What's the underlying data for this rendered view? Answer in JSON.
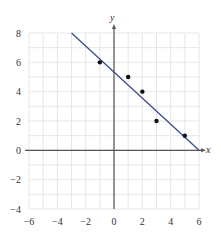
{
  "chart_data": {
    "type": "scatter",
    "title": "",
    "xlabel": "x",
    "ylabel": "y",
    "xlim": [
      -6,
      6
    ],
    "ylim": [
      -4,
      8
    ],
    "grid": true,
    "grid_step": 1,
    "x_ticks": [
      -6,
      -4,
      -2,
      0,
      2,
      4,
      6
    ],
    "y_ticks": [
      -4,
      -2,
      0,
      2,
      4,
      6,
      8
    ],
    "x_tick_labels": [
      "−6",
      "−4",
      "−2",
      "0",
      "2",
      "4",
      "6"
    ],
    "y_tick_labels": [
      "−4",
      "−2",
      "0",
      "2",
      "4",
      "6",
      "8"
    ],
    "points": [
      {
        "x": -1,
        "y": 6
      },
      {
        "x": 1,
        "y": 5
      },
      {
        "x": 2,
        "y": 4
      },
      {
        "x": 3,
        "y": 2
      },
      {
        "x": 5,
        "y": 1
      }
    ],
    "fit_line": {
      "x1": -3,
      "y1": 8,
      "x2": 6,
      "y2": 0
    },
    "colors": {
      "grid": "#e6e6e6",
      "axis": "#555555",
      "line": "#3b4a8a",
      "point": "#111111"
    }
  }
}
